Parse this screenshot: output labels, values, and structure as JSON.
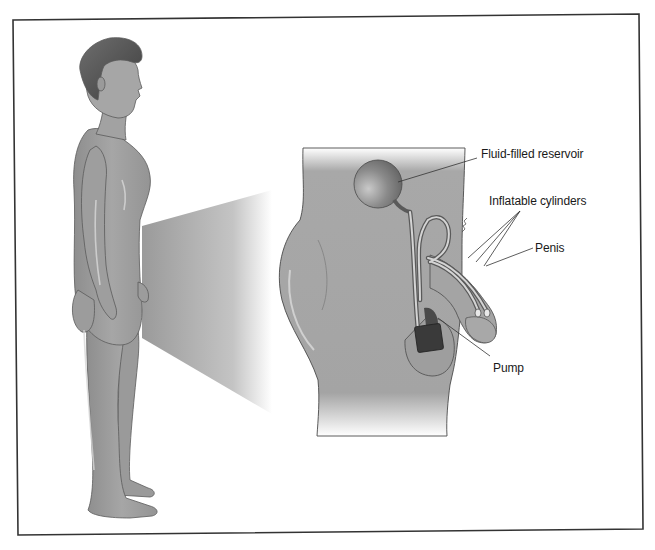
{
  "figure": {
    "labels": {
      "reservoir": "Fluid-filled reservoir",
      "cylinders": "Inflatable cylinders",
      "penis": "Penis",
      "pump": "Pump"
    },
    "colors": {
      "frame": "#333333",
      "skin": "#a0a0a0",
      "skin_shadow": "#7d7d7d",
      "skin_highlight": "#d2d2d2",
      "hair": "#5a5a5a",
      "reservoir": "#8c8c8c",
      "pump": "#3c3c3c",
      "tube": "#c8c8c8",
      "leader": "#333333"
    }
  }
}
